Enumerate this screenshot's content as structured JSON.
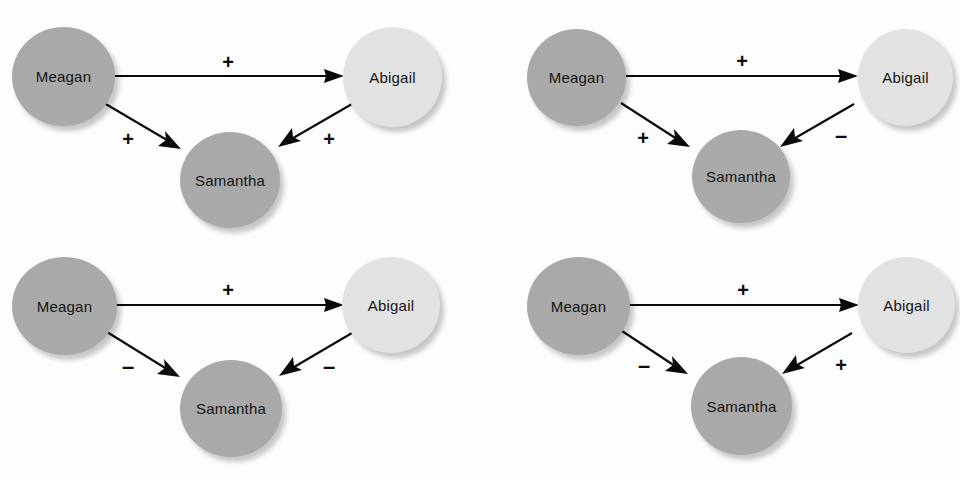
{
  "figure": {
    "background_color": "#fdfdfd",
    "node_dark_color": "#a9a9a9",
    "node_light_color": "#e2e2e2",
    "edge_color": "#0a0a0a",
    "label_color": "#141414"
  },
  "names": {
    "meagan": "Meagan",
    "abigail": "Abigail",
    "samantha": "Samantha"
  },
  "signs": {
    "plus": "+",
    "minus": "–"
  },
  "panels": [
    {
      "id": "panel-top-left",
      "position": "top-left",
      "nodes": [
        {
          "id": "meagan",
          "label": "Meagan",
          "shade": "dark"
        },
        {
          "id": "abigail",
          "label": "Abigail",
          "shade": "light"
        },
        {
          "id": "samantha",
          "label": "Samantha",
          "shade": "dark"
        }
      ],
      "edges": [
        {
          "id": "meagan-abigail",
          "from": "Meagan",
          "to": "Abigail",
          "sign": "+"
        },
        {
          "id": "meagan-samantha",
          "from": "Meagan",
          "to": "Samantha",
          "sign": "+"
        },
        {
          "id": "abigail-samantha",
          "from": "Abigail",
          "to": "Samantha",
          "sign": "+"
        }
      ]
    },
    {
      "id": "panel-top-right",
      "position": "top-right",
      "nodes": [
        {
          "id": "meagan",
          "label": "Meagan",
          "shade": "dark"
        },
        {
          "id": "abigail",
          "label": "Abigail",
          "shade": "light"
        },
        {
          "id": "samantha",
          "label": "Samantha",
          "shade": "dark"
        }
      ],
      "edges": [
        {
          "id": "meagan-abigail",
          "from": "Meagan",
          "to": "Abigail",
          "sign": "+"
        },
        {
          "id": "meagan-samantha",
          "from": "Meagan",
          "to": "Samantha",
          "sign": "+"
        },
        {
          "id": "abigail-samantha",
          "from": "Abigail",
          "to": "Samantha",
          "sign": "–"
        }
      ]
    },
    {
      "id": "panel-bottom-left",
      "position": "bottom-left",
      "nodes": [
        {
          "id": "meagan",
          "label": "Meagan",
          "shade": "dark"
        },
        {
          "id": "abigail",
          "label": "Abigail",
          "shade": "light"
        },
        {
          "id": "samantha",
          "label": "Samantha",
          "shade": "dark"
        }
      ],
      "edges": [
        {
          "id": "meagan-abigail",
          "from": "Meagan",
          "to": "Abigail",
          "sign": "+"
        },
        {
          "id": "meagan-samantha",
          "from": "Meagan",
          "to": "Samantha",
          "sign": "–"
        },
        {
          "id": "abigail-samantha",
          "from": "Abigail",
          "to": "Samantha",
          "sign": "–"
        }
      ]
    },
    {
      "id": "panel-bottom-right",
      "position": "bottom-right",
      "nodes": [
        {
          "id": "meagan",
          "label": "Meagan",
          "shade": "dark"
        },
        {
          "id": "abigail",
          "label": "Abigail",
          "shade": "light"
        },
        {
          "id": "samantha",
          "label": "Samantha",
          "shade": "dark"
        }
      ],
      "edges": [
        {
          "id": "meagan-abigail",
          "from": "Meagan",
          "to": "Abigail",
          "sign": "+"
        },
        {
          "id": "meagan-samantha",
          "from": "Meagan",
          "to": "Samantha",
          "sign": "–"
        },
        {
          "id": "abigail-samantha",
          "from": "Abigail",
          "to": "Samantha",
          "sign": "+"
        }
      ]
    }
  ]
}
